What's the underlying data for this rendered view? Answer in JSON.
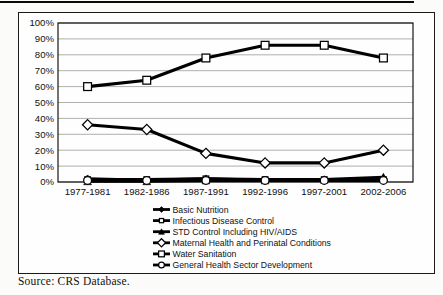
{
  "page": {
    "source_note": "Source: CRS Database."
  },
  "chart_data": {
    "type": "line",
    "title": "",
    "xlabel": "",
    "ylabel": "",
    "categories": [
      "1977-1981",
      "1982-1986",
      "1987-1991",
      "1992-1996",
      "1997-2001",
      "2002-2006"
    ],
    "series": [
      {
        "name": "Basic Nutrition",
        "marker": "filled-diamond",
        "values": [
          2,
          1,
          2,
          1,
          1,
          2
        ]
      },
      {
        "name": "Infectious Disease Control",
        "marker": "open-square-small",
        "values": [
          1.5,
          1.5,
          2,
          1.5,
          1.5,
          1.5
        ]
      },
      {
        "name": "STD Control Including HIV/AIDS",
        "marker": "filled-triangle",
        "values": [
          0.5,
          0.5,
          1,
          1,
          1.5,
          3
        ]
      },
      {
        "name": "Maternal Health and Perinatal Conditions",
        "marker": "open-diamond",
        "values": [
          36,
          33,
          18,
          12,
          12,
          20
        ]
      },
      {
        "name": "Water Sanitation",
        "marker": "open-square",
        "values": [
          60,
          64,
          78,
          86,
          86,
          78
        ]
      },
      {
        "name": "General Health Sector Development",
        "marker": "open-circle",
        "values": [
          1,
          1,
          1,
          1,
          1,
          1
        ]
      }
    ],
    "ylim": [
      0,
      100
    ],
    "ytick_step": 10,
    "ytick_format": "percent",
    "grid": "horizontal",
    "legend_position": "bottom-left-indented",
    "line_color": "#000000",
    "marker_fill_open": "#ffffff",
    "grid_color": "#9a9a9a",
    "axis_text_color": "#111111"
  }
}
